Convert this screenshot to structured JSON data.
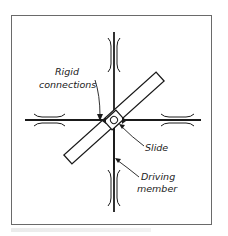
{
  "diagram": {
    "type": "mechanism-sketch",
    "labels": {
      "rigid_connections": [
        "Rigid",
        "connections"
      ],
      "slide": "Slide",
      "driving_member": [
        "Driving",
        "member"
      ]
    },
    "colors": {
      "line": "#1a1a1a",
      "frame": "#6a6a6a",
      "background": "#ffffff"
    },
    "components": [
      {
        "name": "vertical-bar",
        "role": "driving member"
      },
      {
        "name": "horizontal-bar",
        "role": "driven bar"
      },
      {
        "name": "diagonal-bar",
        "role": "rotating link"
      },
      {
        "name": "slide-block",
        "role": "slide at intersection"
      },
      {
        "name": "guides",
        "count": 4
      }
    ]
  }
}
